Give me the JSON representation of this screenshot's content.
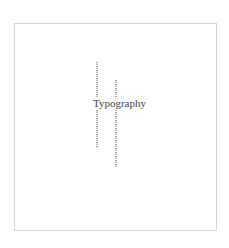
{
  "canvas": {
    "title": "Typography",
    "frame_border_color": "#d6d6d6",
    "text_color": "#444444"
  },
  "columns": [
    {
      "name": "left-vertical-text-column",
      "note": "tiny rotated text, illegible"
    },
    {
      "name": "right-vertical-text-column",
      "note": "tiny rotated text, illegible"
    }
  ]
}
